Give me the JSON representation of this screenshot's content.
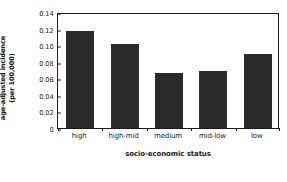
{
  "chart_data": {
    "type": "bar",
    "title": "",
    "subtitle": "",
    "xlabel": "socio-economic status",
    "ylabel": "age-adjusted incidence (per 100,000)",
    "ylabel_lines": [
      "age-adjusted incidence",
      "(per 100,000)"
    ],
    "categories": [
      "high",
      "high-mid",
      "medium",
      "mid-low",
      "low"
    ],
    "values": [
      0.117,
      0.102,
      0.066,
      0.069,
      0.089
    ],
    "ylim": [
      0,
      0.14
    ],
    "yticks": [
      0,
      0.02,
      0.04,
      0.06,
      0.08,
      0.1,
      0.12,
      0.14
    ],
    "ytick_labels": [
      "0",
      "0.02",
      "0.04",
      "0.06",
      "0.08",
      "0.10",
      "0.12",
      "0.14"
    ],
    "grid": false,
    "legend": null,
    "legend_position": "none",
    "bar_color": "#2b2b2b",
    "axis_color": "#1a1a1a",
    "background_color": "#ffffff"
  }
}
